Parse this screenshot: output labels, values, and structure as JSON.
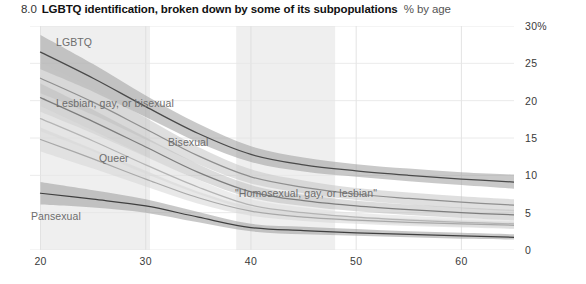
{
  "header": {
    "figure_number": "8.0",
    "title": "LGBTQ identification, broken down by some of its subpopulations",
    "units": "% by age"
  },
  "chart_data": {
    "type": "line",
    "title": "LGBTQ identification, broken down by some of its subpopulations",
    "subtitle": "% by age",
    "xlabel": "",
    "ylabel": "",
    "xlim": [
      19,
      65
    ],
    "ylim": [
      0,
      30
    ],
    "xticks": [
      "20",
      "30",
      "40",
      "50",
      "60"
    ],
    "xtick_values": [
      20,
      30,
      40,
      50,
      60
    ],
    "yticks": [
      "0",
      "5",
      "10",
      "15",
      "20",
      "25",
      "30%"
    ],
    "ytick_values": [
      0,
      5,
      10,
      15,
      20,
      25,
      30
    ],
    "grid": "both",
    "legend_position": "inline-labels",
    "x": [
      20,
      25,
      30,
      35,
      40,
      45,
      50,
      55,
      60,
      65
    ],
    "series": [
      {
        "name": "LGBTQ",
        "color": "#4a4a4a",
        "band_color": "#9d9d9d",
        "values": [
          26.5,
          23.0,
          19.2,
          15.6,
          12.8,
          11.4,
          10.6,
          10.0,
          9.5,
          9.1
        ],
        "band_low": [
          24.2,
          21.2,
          17.8,
          14.4,
          11.8,
          10.5,
          9.8,
          9.2,
          8.7,
          8.2
        ],
        "band_high": [
          28.8,
          24.9,
          20.7,
          16.9,
          13.9,
          12.4,
          11.5,
          10.9,
          10.4,
          10.1
        ],
        "label": "LGBTQ"
      },
      {
        "name": "Lesbian, gay, or bisexual",
        "color": "#8f8f8f",
        "band_color": "#c4c4c4",
        "values": [
          23.0,
          19.8,
          16.2,
          12.6,
          9.8,
          8.4,
          7.5,
          6.9,
          6.4,
          6.0
        ],
        "band_low": [
          21.0,
          18.1,
          14.8,
          11.5,
          8.9,
          7.6,
          6.7,
          6.1,
          5.6,
          5.2
        ],
        "band_high": [
          25.1,
          21.6,
          17.7,
          13.8,
          10.8,
          9.3,
          8.3,
          7.7,
          7.2,
          6.8
        ],
        "label": "Lesbian, gay, or bisexual"
      },
      {
        "name": "Bisexual",
        "color": "#7d7d7d",
        "band_color": "#bdbdbd",
        "values": [
          20.4,
          17.2,
          13.8,
          10.4,
          7.8,
          6.6,
          5.9,
          5.4,
          5.0,
          4.7
        ],
        "band_low": [
          18.5,
          15.6,
          12.5,
          9.4,
          7.0,
          5.9,
          5.2,
          4.7,
          4.3,
          4.0
        ],
        "band_high": [
          22.3,
          18.8,
          15.1,
          11.5,
          8.7,
          7.4,
          6.6,
          6.1,
          5.7,
          5.4
        ],
        "label": "Bisexual"
      },
      {
        "name": "Queer",
        "color": "#b4b4b4",
        "band_color": "#dcdcdc",
        "values": [
          17.6,
          14.6,
          11.4,
          8.4,
          6.0,
          5.0,
          4.4,
          4.0,
          3.7,
          3.5
        ],
        "band_low": [
          15.9,
          13.2,
          10.2,
          7.5,
          5.3,
          4.4,
          3.8,
          3.4,
          3.1,
          2.9
        ],
        "band_high": [
          19.3,
          16.0,
          12.6,
          9.4,
          6.8,
          5.7,
          5.0,
          4.6,
          4.3,
          4.1
        ],
        "label": "Queer"
      },
      {
        "name": "\"Homosexual, gay, or lesbian\"",
        "color": "#a8a8a8",
        "band_color": "#d6d6d6",
        "values": [
          14.8,
          12.2,
          9.5,
          7.0,
          5.2,
          4.4,
          4.0,
          3.7,
          3.5,
          3.3
        ],
        "band_low": [
          13.2,
          10.9,
          8.5,
          6.2,
          4.6,
          3.9,
          3.5,
          3.2,
          3.0,
          2.8
        ],
        "band_high": [
          16.4,
          13.5,
          10.6,
          7.8,
          5.8,
          5.0,
          4.5,
          4.2,
          4.0,
          3.8
        ],
        "label": "\"Homosexual, gay, or lesbian\""
      },
      {
        "name": "Pansexual",
        "color": "#3f3f3f",
        "band_color": "#9a9a9a",
        "values": [
          7.6,
          6.8,
          5.9,
          4.4,
          3.0,
          2.6,
          2.3,
          2.1,
          1.9,
          1.7
        ],
        "band_low": [
          6.1,
          5.7,
          5.0,
          3.7,
          2.5,
          2.1,
          1.9,
          1.7,
          1.5,
          1.4
        ],
        "band_high": [
          9.1,
          8.0,
          6.8,
          5.1,
          3.5,
          3.1,
          2.8,
          2.5,
          2.3,
          2.1
        ],
        "label": "Pansexual"
      }
    ],
    "shaded_bands": [
      {
        "x_start": 20.0,
        "x_end": 30.4
      },
      {
        "x_start": 38.6,
        "x_end": 48.0
      }
    ]
  },
  "annotations": {
    "lgbtq": "LGBTQ",
    "lgb": "Lesbian, gay, or bisexual",
    "bisexual": "Bisexual",
    "queer": "Queer",
    "homosexual": "\"Homosexual, gay, or lesbian\"",
    "pansexual": "Pansexual"
  }
}
